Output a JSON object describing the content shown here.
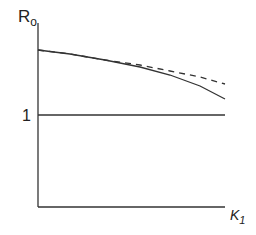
{
  "chart_data": {
    "type": "line",
    "title": "",
    "xlabel": "K1",
    "ylabel": "R0",
    "xlabel_main": "K",
    "xlabel_sub": "1",
    "ylabel_main": "R",
    "ylabel_sub": "o",
    "y_ticks": [
      {
        "value": 1,
        "label": "1"
      }
    ],
    "x_ticks": [],
    "grid": false,
    "legend": null,
    "series": [
      {
        "name": "solid curve",
        "style": "solid",
        "points_px": [
          [
            38,
            50
          ],
          [
            70,
            54
          ],
          [
            105,
            60
          ],
          [
            140,
            67
          ],
          [
            170,
            75
          ],
          [
            200,
            86
          ],
          [
            225,
            99
          ]
        ]
      },
      {
        "name": "dashed curve",
        "style": "dashed",
        "points_px": [
          [
            38,
            50
          ],
          [
            70,
            54
          ],
          [
            105,
            60
          ],
          [
            140,
            65
          ],
          [
            170,
            71
          ],
          [
            200,
            77
          ],
          [
            225,
            84
          ]
        ]
      },
      {
        "name": "R0 = 1 reference",
        "style": "solid",
        "points_px": [
          [
            38,
            115
          ],
          [
            225,
            115
          ]
        ]
      }
    ],
    "axes_px": {
      "origin": [
        38,
        207
      ],
      "x_end": 225,
      "y_top": 23
    }
  }
}
